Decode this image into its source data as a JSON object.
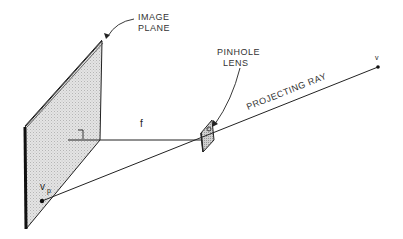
{
  "diagram": {
    "type": "pinhole-camera-projection",
    "labels": {
      "image_plane_line1": "IMAGE",
      "image_plane_line2": "PLANE",
      "pinhole_line1": "PINHOLE",
      "pinhole_line2": "LENS",
      "projecting_ray": "PROJECTING RAY",
      "focal_length": "f",
      "point": "v",
      "projected_point_base": "v",
      "projected_point_sub": "p"
    },
    "colors": {
      "line": "#222222",
      "plane_fill": "#d8d8d8",
      "plane_edge": "#111111"
    }
  }
}
